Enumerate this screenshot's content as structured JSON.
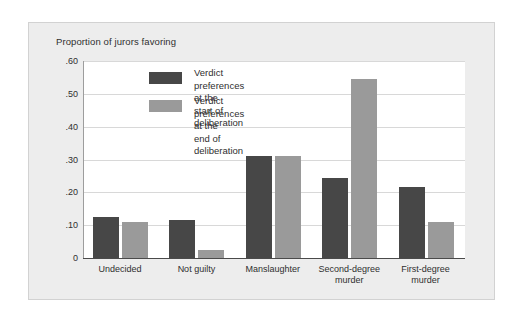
{
  "chart_data": {
    "type": "bar",
    "title": "Proportion of jurors favoring",
    "xlabel": "",
    "ylabel": "",
    "ylim": [
      0,
      0.6
    ],
    "grid": true,
    "legend_position": "inside-top-left",
    "categories": [
      "Undecided",
      "Not guilty",
      "Manslaughter",
      "Second-degree\nmurder",
      "First-degree\nmurder"
    ],
    "y_ticks": [
      ".60",
      ".50",
      ".40",
      ".30",
      ".20",
      ".10",
      "0"
    ],
    "y_tick_values": [
      0.6,
      0.5,
      0.4,
      0.3,
      0.2,
      0.1,
      0
    ],
    "series": [
      {
        "name": "Verdict preferences at the\nstart of deliberation",
        "color": "#474747",
        "values": [
          0.125,
          0.115,
          0.31,
          0.245,
          0.215
        ]
      },
      {
        "name": "Verdict preferences at the\nend of deliberation",
        "color": "#9a9a9a",
        "values": [
          0.11,
          0.025,
          0.31,
          0.545,
          0.11
        ]
      }
    ]
  },
  "legend": {
    "items": [
      {
        "label": "Verdict preferences at the\nstart of deliberation"
      },
      {
        "label": "Verdict preferences at the\nend of deliberation"
      }
    ]
  },
  "colors": {
    "series_start": "#474747",
    "series_end": "#9a9a9a",
    "panel_background": "#ededed",
    "plot_background": "#ffffff",
    "gridline": "#d8d8d8",
    "axis": "#4a4a4a"
  }
}
